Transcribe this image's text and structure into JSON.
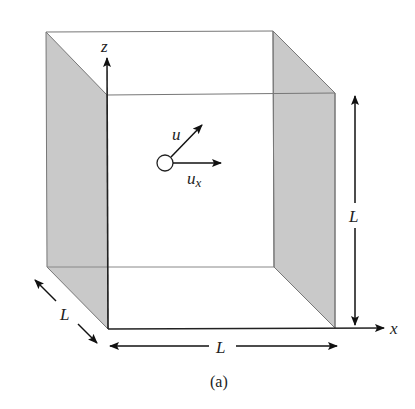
{
  "figure": {
    "caption": "(a)",
    "colors": {
      "background": "#ffffff",
      "shaded_face": "#c9c9c9",
      "edge": "#777777",
      "front_edge": "#222222",
      "arrow": "#111111",
      "text": "#222222"
    },
    "axes": {
      "z_label": "z",
      "x_label": "x"
    },
    "particle": {
      "velocity_label": "u",
      "component_label_base": "u",
      "component_label_sub": "x"
    },
    "dimensions": {
      "depth_label": "L",
      "width_label": "L",
      "height_label": "L"
    }
  }
}
